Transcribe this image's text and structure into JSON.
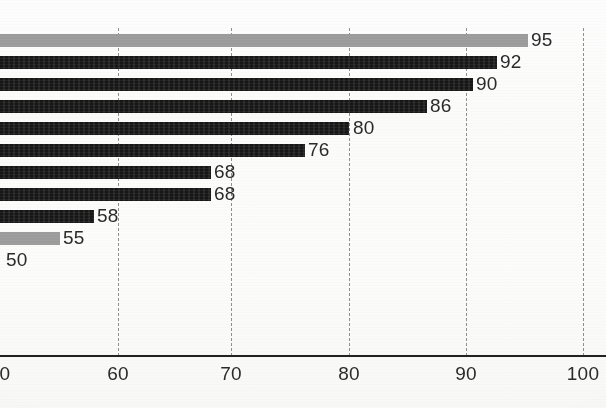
{
  "chart_data": {
    "type": "bar",
    "orientation": "horizontal",
    "title": "",
    "subtitle": "",
    "xlabel": "",
    "ylabel": "",
    "xlim": [
      50,
      100
    ],
    "grid": true,
    "grid_style": "dotted-vertical",
    "legend": null,
    "categories": [
      "",
      "",
      "",
      "",
      "",
      "",
      "",
      "",
      "",
      "",
      ""
    ],
    "values": [
      95,
      92,
      90,
      86,
      80,
      76,
      68,
      68,
      58,
      55,
      50
    ],
    "data_labels": [
      "95",
      "92",
      "90",
      "86",
      "80",
      "76",
      "68",
      "68",
      "58",
      "55",
      "50"
    ],
    "bar_colors": [
      "#9b9b9b",
      "#161616",
      "#161616",
      "#161616",
      "#161616",
      "#161616",
      "#161616",
      "#161616",
      "#161616",
      "#9b9b9b",
      "#9b9b9b"
    ],
    "x_ticks": [
      50,
      60,
      70,
      80,
      90,
      100
    ],
    "x_tick_labels": [
      "50",
      "60",
      "70",
      "80",
      "90",
      "100"
    ]
  },
  "axis": {
    "ticks": [
      {
        "value": 50,
        "label": "50",
        "x": 2,
        "clipped": true
      },
      {
        "value": 60,
        "label": "60",
        "x": 118,
        "clipped": false
      },
      {
        "value": 70,
        "label": "70",
        "x": 231,
        "clipped": false
      },
      {
        "value": 80,
        "label": "80",
        "x": 349,
        "clipped": false
      },
      {
        "value": 90,
        "label": "90",
        "x": 466,
        "clipped": false
      },
      {
        "value": 100,
        "label": "100",
        "x": 583,
        "clipped": false
      }
    ]
  },
  "bars": [
    {
      "label": "95",
      "value": 95,
      "color": "gray",
      "width": 528,
      "top": 30,
      "label_x": 531
    },
    {
      "label": "92",
      "value": 92,
      "color": "dark",
      "width": 497,
      "top": 52,
      "label_x": 500
    },
    {
      "label": "90",
      "value": 90,
      "color": "dark",
      "width": 473,
      "top": 74,
      "label_x": 476
    },
    {
      "label": "86",
      "value": 86,
      "color": "dark",
      "width": 427,
      "top": 96,
      "label_x": 430
    },
    {
      "label": "80",
      "value": 80,
      "color": "dark",
      "width": 349,
      "top": 118,
      "label_x": 353
    },
    {
      "label": "76",
      "value": 76,
      "color": "dark",
      "width": 305,
      "top": 140,
      "label_x": 308
    },
    {
      "label": "68",
      "value": 68,
      "color": "dark",
      "width": 211,
      "top": 162,
      "label_x": 214
    },
    {
      "label": "68",
      "value": 68,
      "color": "dark",
      "width": 211,
      "top": 184,
      "label_x": 214
    },
    {
      "label": "58",
      "value": 58,
      "color": "dark",
      "width": 94,
      "top": 206,
      "label_x": 97
    },
    {
      "label": "55",
      "value": 55,
      "color": "gray",
      "width": 60,
      "top": 228,
      "label_x": 63
    },
    {
      "label": "50",
      "value": 50,
      "color": "gray",
      "width": 0,
      "top": 250,
      "label_x": 6
    }
  ],
  "colors": {
    "bar_dark": "#161616",
    "bar_gray": "#9b9b9b",
    "gridline": "#7d7d7d",
    "axis_line": "#232323",
    "text": "#2a2a2a",
    "background": "#fbfbfa"
  }
}
